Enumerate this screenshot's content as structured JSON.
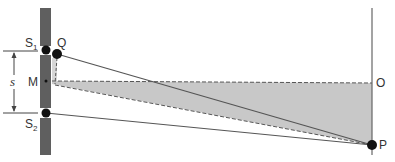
{
  "diagram": {
    "type": "double-slit geometry",
    "labels": {
      "s1": "S",
      "s1_sub": "1",
      "s2": "S",
      "s2_sub": "2",
      "q": "Q",
      "m": "M",
      "s": "s",
      "o": "O",
      "p": "P"
    },
    "colors": {
      "barrier": "#5f5f5f",
      "lines": "#555555",
      "shade": "#c8c8c8",
      "dots": "#111111",
      "screen": "#666666"
    },
    "points": {
      "S1": [
        46,
        50
      ],
      "Q": [
        57,
        54
      ],
      "M": [
        46,
        81
      ],
      "S2": [
        46,
        113
      ],
      "O": [
        372,
        83
      ],
      "P": [
        372,
        145
      ]
    }
  }
}
